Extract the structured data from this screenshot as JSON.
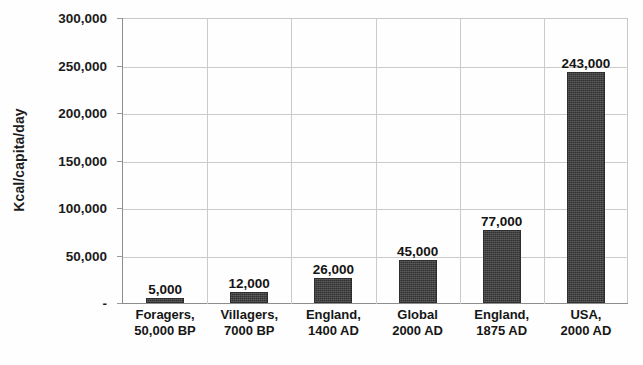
{
  "chart_data": {
    "type": "bar",
    "title": "",
    "xlabel": "",
    "ylabel": "Kcal/capita/day",
    "ylim": [
      0,
      300000
    ],
    "ytick_values": [
      300000,
      250000,
      200000,
      150000,
      100000,
      50000,
      0
    ],
    "ytick_labels": [
      "300,000",
      "250,000",
      "200,000",
      "150,000",
      "100,000",
      "50,000",
      "-"
    ],
    "grid": "both",
    "legend": "none",
    "categories": [
      {
        "line1": "Foragers,",
        "line2": "50,000 BP"
      },
      {
        "line1": "Villagers,",
        "line2": "7000 BP"
      },
      {
        "line1": "England,",
        "line2": "1400 AD"
      },
      {
        "line1": "Global",
        "line2": "2000 AD"
      },
      {
        "line1": "England,",
        "line2": "1875 AD"
      },
      {
        "line1": "USA,",
        "line2": "2000 AD"
      }
    ],
    "values": [
      5000,
      12000,
      26000,
      45000,
      77000,
      243000
    ],
    "data_labels": [
      "5,000",
      "12,000",
      "26,000",
      "45,000",
      "77,000",
      "243,000"
    ],
    "bar_color": "#3b3b3b",
    "gridline_color": "#cbcbcb",
    "axis_color": "#8d8d8d",
    "background_color": "#fefefe"
  }
}
